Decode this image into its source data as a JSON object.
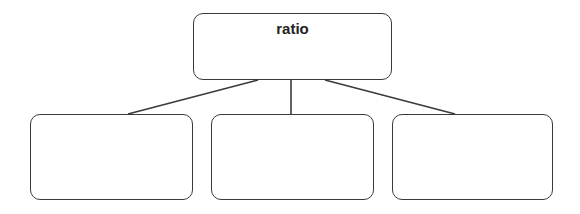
{
  "diagram": {
    "type": "tree",
    "root": {
      "label": "ratio"
    },
    "children": [
      {
        "label": ""
      },
      {
        "label": ""
      },
      {
        "label": ""
      }
    ],
    "colors": {
      "stroke": "#3a3a3a",
      "text": "#222222",
      "background": "#ffffff"
    }
  }
}
